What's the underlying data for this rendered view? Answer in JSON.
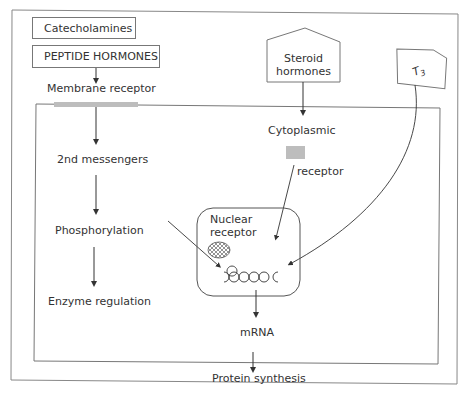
{
  "diagram": {
    "inputs": {
      "catecholamines": "Catecholamines",
      "peptide_hormones": "PEPTIDE HORMONES",
      "steroid_hormones_line1": "Steroid",
      "steroid_hormones_line2": "hormones",
      "t3": "T",
      "t3_sub": "3"
    },
    "membrane_pathway": {
      "membrane_receptor": "Membrane receptor",
      "second_messengers": "2nd messengers",
      "phosphorylation": "Phosphorylation",
      "enzyme_regulation": "Enzyme regulation"
    },
    "steroid_pathway": {
      "cytoplasmic": "Cytoplasmic",
      "receptor": "receptor"
    },
    "nucleus": {
      "nuclear_receptor_line1": "Nuclear",
      "nuclear_receptor_line2": "receptor"
    },
    "outputs": {
      "mrna": "mRNA",
      "protein_synthesis": "Protein synthesis"
    },
    "colors": {
      "line": "#666666",
      "receptor_fill": "#bdbdbd",
      "background": "#ffffff"
    }
  }
}
